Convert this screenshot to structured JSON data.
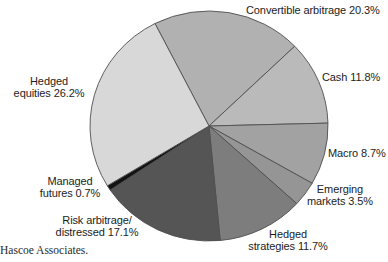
{
  "caption": "Hascoe Associates.",
  "colors": {
    "background": "#ffffff",
    "stroke": "#4f4f4f",
    "label_text": "#1c1c1c",
    "caption_text": "#2a2a2a"
  },
  "chart_data": {
    "type": "pie",
    "title": "",
    "legend": "none (direct labels around pie)",
    "start_angle_deg": -27,
    "center": {
      "x": 209,
      "y": 126
    },
    "radius": {
      "rx": 119,
      "ry": 115
    },
    "total": 100.0,
    "categories": [
      "Convertible arbitrage",
      "Cash",
      "Macro",
      "Emerging markets",
      "Hedged strategies",
      "Risk arbitrage/distressed",
      "Managed futures",
      "Hedged equities"
    ],
    "values": [
      20.3,
      11.8,
      8.7,
      3.5,
      11.7,
      17.1,
      0.7,
      26.2
    ],
    "slices": [
      {
        "name": "Convertible arbitrage",
        "value": 20.3,
        "color": "#b1b1b1",
        "label_lines": [
          "Convertible arbitrage 20.3%"
        ],
        "label": {
          "x": 246,
          "y": 4,
          "align": "left"
        }
      },
      {
        "name": "Cash",
        "value": 11.8,
        "color": "#bababa",
        "label_lines": [
          "Cash 11.8%"
        ],
        "label": {
          "x": 322,
          "y": 71,
          "align": "left"
        }
      },
      {
        "name": "Macro",
        "value": 8.7,
        "color": "#a2a2a2",
        "label_lines": [
          "Macro 8.7%"
        ],
        "label": {
          "x": 328,
          "y": 147,
          "align": "left"
        }
      },
      {
        "name": "Emerging markets",
        "value": 3.5,
        "color": "#959595",
        "label_lines": [
          "Emerging",
          "markets 3.5%"
        ],
        "label": {
          "x": 340,
          "y": 183,
          "align": "center"
        }
      },
      {
        "name": "Hedged strategies",
        "value": 11.7,
        "color": "#7d7d7d",
        "label_lines": [
          "Hedged",
          "strategies 11.7%"
        ],
        "label": {
          "x": 288,
          "y": 228,
          "align": "center"
        }
      },
      {
        "name": "Risk arbitrage/distressed",
        "value": 17.1,
        "color": "#555555",
        "label_lines": [
          "Risk arbitrage/",
          "distressed 17.1%"
        ],
        "label": {
          "x": 97,
          "y": 214,
          "align": "center"
        }
      },
      {
        "name": "Managed futures",
        "value": 0.7,
        "color": "#141414",
        "label_lines": [
          "Managed",
          "futures 0.7%"
        ],
        "label": {
          "x": 70,
          "y": 175,
          "align": "center"
        }
      },
      {
        "name": "Hedged equities",
        "value": 26.2,
        "color": "#d8d8d8",
        "label_lines": [
          "Hedged",
          "equities 26.2%"
        ],
        "label": {
          "x": 49,
          "y": 75,
          "align": "center"
        }
      }
    ]
  }
}
